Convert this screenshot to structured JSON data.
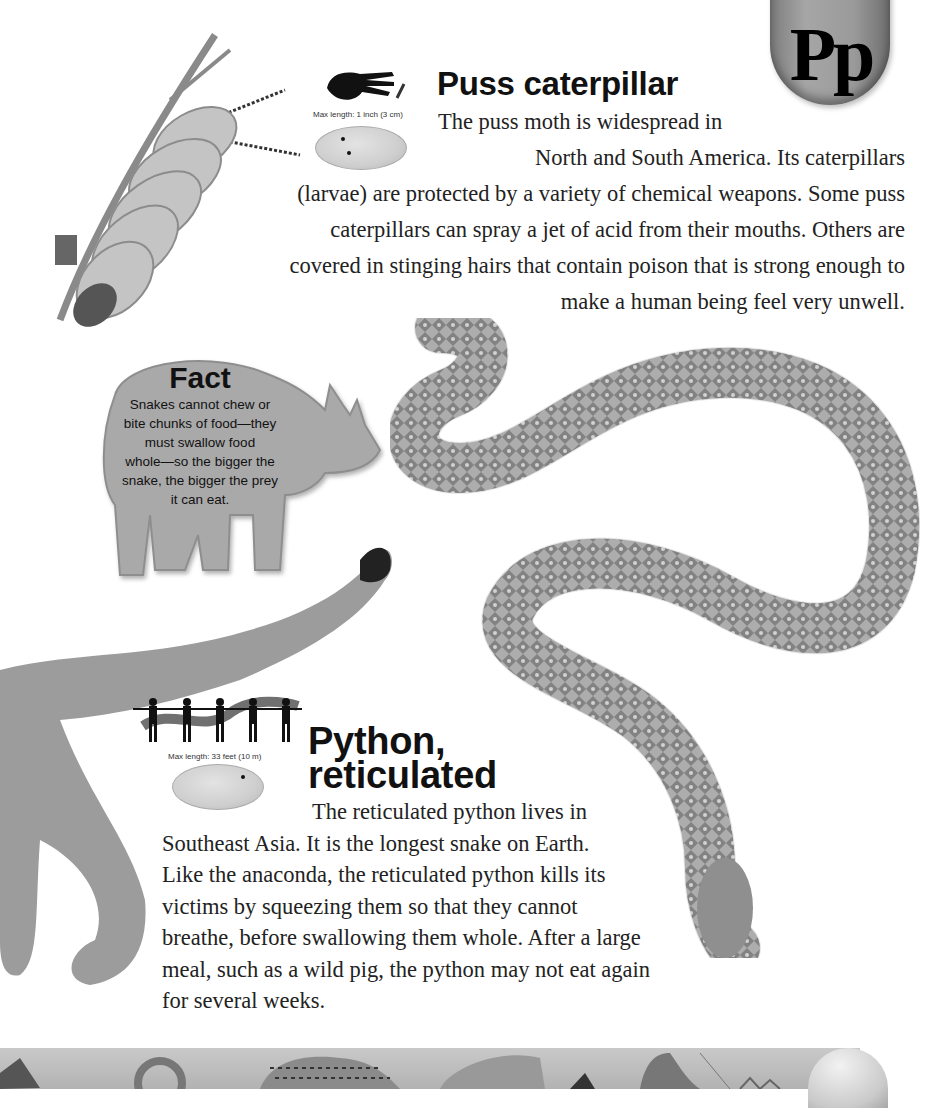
{
  "page": {
    "letter_tab": "Pp",
    "colors": {
      "background": "#ffffff",
      "tab": "#9a9a9a",
      "fact_shape": "#a9a9a9",
      "text": "#222222"
    }
  },
  "entries": [
    {
      "title": "Puss caterpillar",
      "size_caption": "Max length: 1 inch (3 cm)",
      "size_icon": "hand-silhouette-icon",
      "map_icon": "world-map-icon",
      "body_lines": [
        "The puss moth is widespread in",
        "North and South America. Its caterpillars",
        "(larvae) are protected by a variety of chemical weapons. Some puss",
        "caterpillars can spray a jet of acid from their mouths. Others are",
        "covered in stinging hairs that contain poison that is strong enough to",
        "make a human being feel very unwell."
      ]
    },
    {
      "title_line1": "Python,",
      "title_line2": "reticulated",
      "size_caption": "Max length: 33 feet (10 m)",
      "size_icon": "human-figures-silhouette-icon",
      "map_icon": "world-map-icon",
      "body_lines": [
        "The reticulated python lives in",
        "Southeast Asia. It is the longest snake on Earth.",
        "Like the anaconda, the reticulated python kills its",
        "victims by squeezing them so that they cannot",
        "breathe, before swallowing them whole. After a large",
        "meal, such as a wild pig, the python may not eat again",
        "for several weeks."
      ]
    }
  ],
  "fact": {
    "title": "Fact",
    "lines": [
      "Snakes cannot chew or",
      "bite chunks of food—they",
      "must swallow food",
      "whole—so the bigger the",
      "snake, the bigger the prey",
      "it can eat."
    ],
    "shape": "rhinoceros-silhouette"
  },
  "illustrations": [
    "puss-caterpillar",
    "reticulated-python",
    "big-cat-tail-and-legs"
  ],
  "footer": {
    "strip": "animal-thumbnails-strip"
  }
}
